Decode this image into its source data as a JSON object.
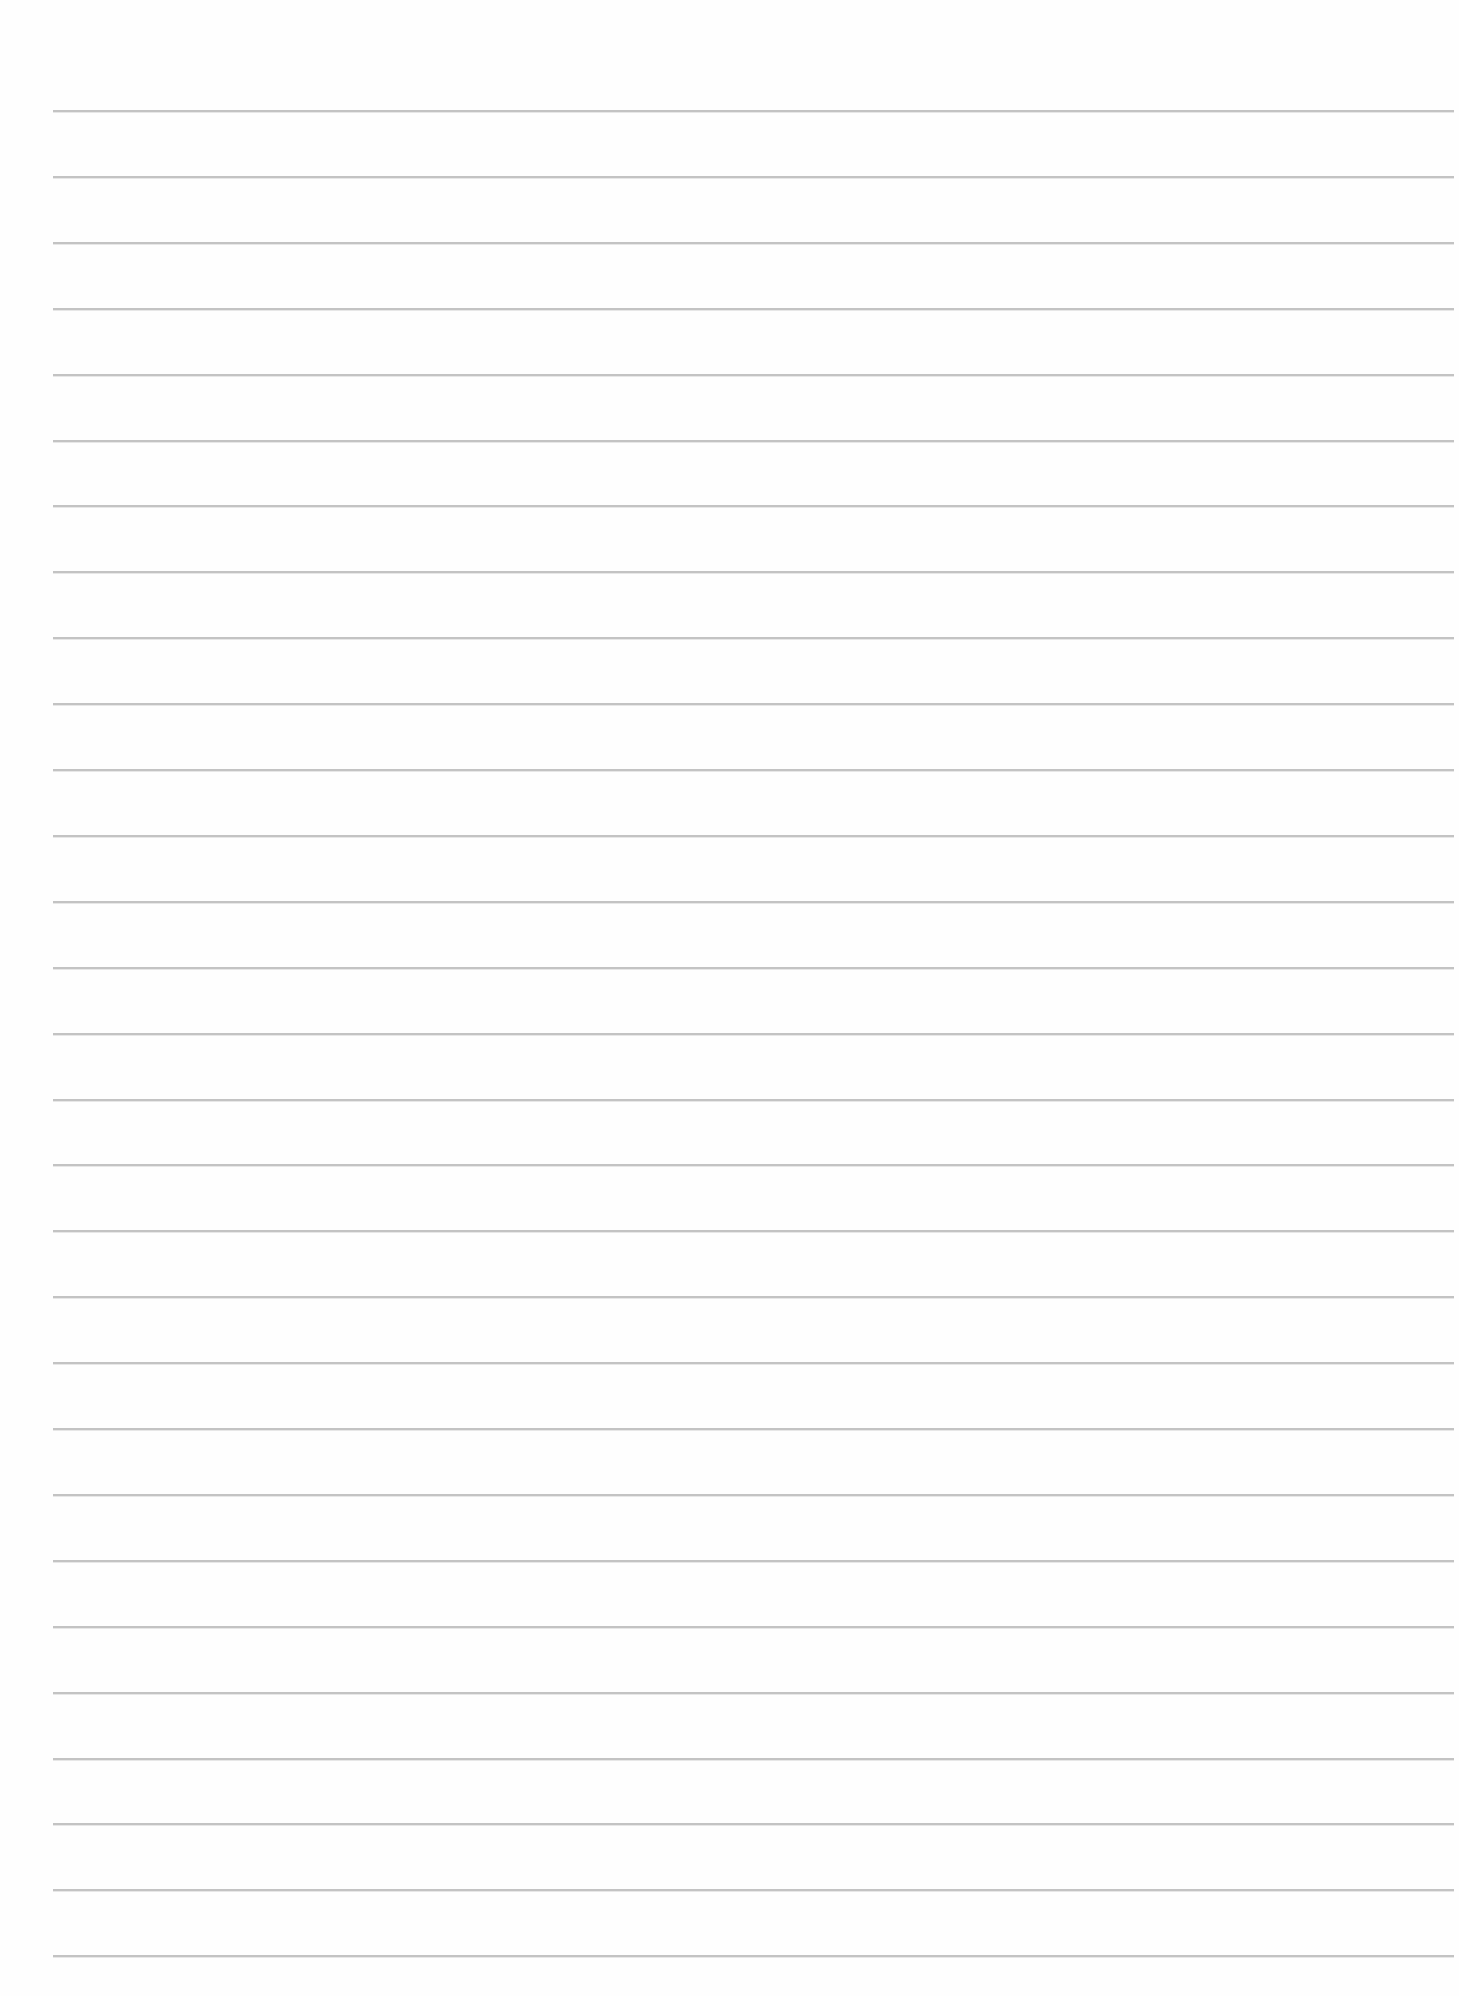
{
  "page": {
    "type": "blank-lined-paper",
    "background_color": "#fefefe",
    "rule_color": "#b9b9b9",
    "rule_count": 29,
    "first_rule_y": 110,
    "rule_spacing": 65.9,
    "rule_left": 53,
    "rule_right": 1454,
    "text_content": []
  }
}
